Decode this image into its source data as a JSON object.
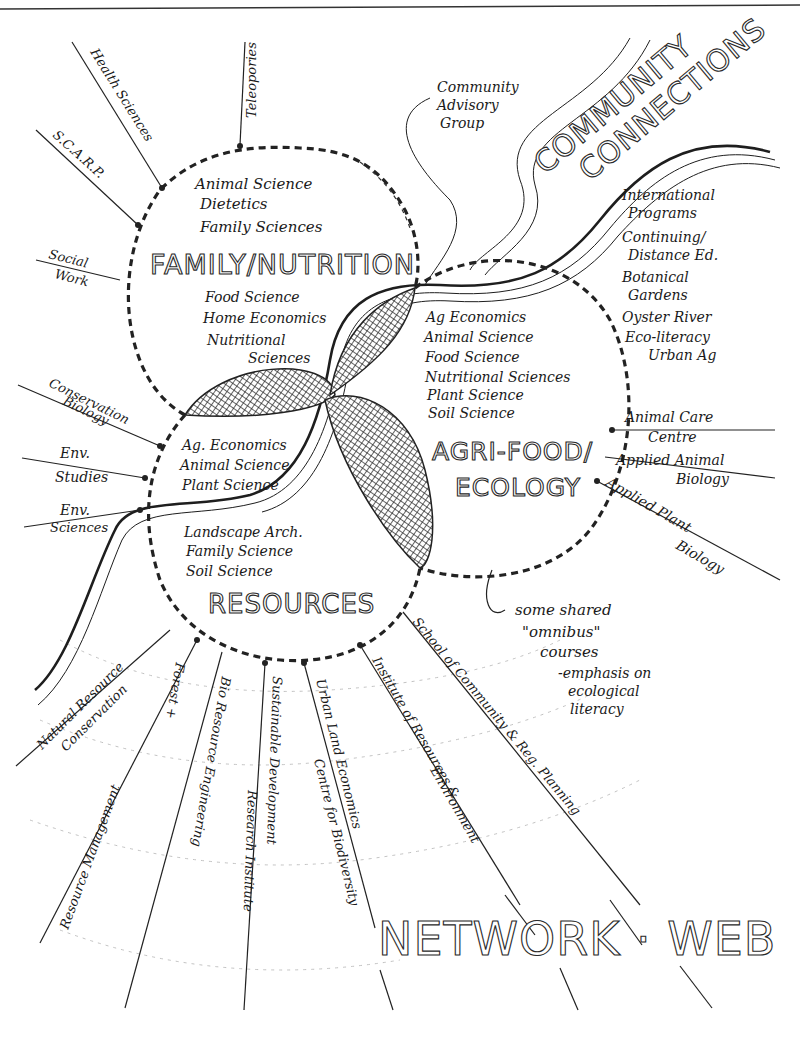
{
  "diagram": {
    "colors": {
      "ink": "#1a1a1a",
      "paper": "#ffffff",
      "hatch": "#222222",
      "faint": "#bbbbbb"
    },
    "headings": {
      "community_connections": [
        "COMMUNITY",
        "CONNECTIONS"
      ],
      "network_web": "NETWORK · WEB"
    },
    "clusters": {
      "family_nutrition": {
        "title": "FAMILY/NUTRITION",
        "items_top": [
          "Animal Science",
          "Dietetics",
          "Family Sciences"
        ],
        "items_bottom": [
          "Food Science",
          "Home Economics",
          "Nutritional",
          "Sciences"
        ]
      },
      "agri_food": {
        "title_line1": "AGRI-FOOD/",
        "title_line2": "ECOLOGY",
        "items": [
          "Ag Economics",
          "Animal Science",
          "Food Science",
          "Nutritional Sciences",
          "Plant Science",
          "Soil Science"
        ]
      },
      "resources": {
        "title": "RESOURCES",
        "items_top": [
          "Ag. Economics",
          "Animal Science",
          "Plant Science"
        ],
        "items_bottom": [
          "Landscape Arch.",
          "Family Science",
          "Soil Science"
        ]
      }
    },
    "left_spokes": {
      "health_sciences": "Health Sciences",
      "scarp": "S.C.A.R.P.",
      "social_work": [
        "Social",
        "Work"
      ],
      "conservation_biology": [
        "Conservation",
        "Biology"
      ],
      "env_studies": [
        "Env.",
        "Studies"
      ],
      "env_sciences": [
        "Env.",
        "Sciences"
      ]
    },
    "top_spokes": {
      "teleporties": "Teleopories",
      "community_advisory": [
        "Community",
        "Advisory",
        "Group"
      ]
    },
    "right_list": [
      [
        "International",
        "Programs"
      ],
      [
        "Continuing/",
        "Distance Ed."
      ],
      [
        "Botanical",
        "Gardens"
      ],
      [
        "Oyster River"
      ],
      [
        "Eco-literacy",
        "Urban Ag"
      ]
    ],
    "right_spokes": {
      "animal_care": [
        "Animal Care",
        "Centre"
      ],
      "applied_animal": [
        "Applied Animal",
        "Biology"
      ],
      "applied_plant": [
        "Applied Plant",
        "Biology"
      ]
    },
    "note": [
      "some shared",
      "\"omnibus\"",
      "courses",
      "-emphasis on",
      "ecological",
      "literacy"
    ],
    "bottom_spokes": {
      "natural_resource": [
        "Natural Resource",
        "Conservation"
      ],
      "forest": [
        "Forest +",
        "Resource Management"
      ],
      "bio_resource": "Bio Resource Engineering",
      "sustainable": [
        "Sustainable Development",
        "Research Institute"
      ],
      "urban_land": [
        "Urban Land Economics",
        "Centre for Biodiversity"
      ],
      "institute": [
        "Institute of Resources &",
        "Environment"
      ],
      "school_community": "School of Community & Reg. Planning"
    }
  }
}
